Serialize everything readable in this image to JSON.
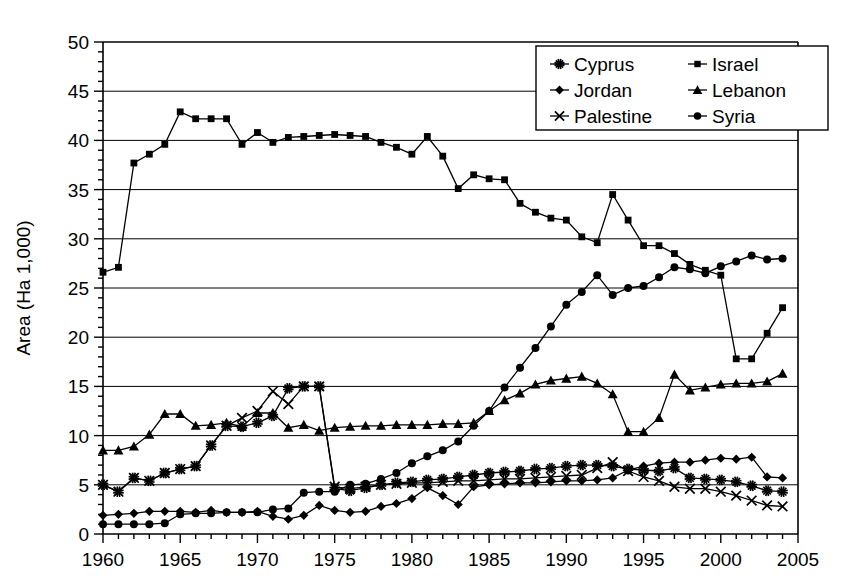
{
  "chart_data": {
    "type": "line",
    "title": "",
    "xlabel": "",
    "ylabel": "Area (Ha 1,000)",
    "xlim": [
      1960,
      2005
    ],
    "ylim": [
      0,
      50
    ],
    "xticks": [
      1960,
      1965,
      1970,
      1975,
      1980,
      1985,
      1990,
      1995,
      2000,
      2005
    ],
    "yticks": [
      0,
      5,
      10,
      15,
      20,
      25,
      30,
      35,
      40,
      45,
      50
    ],
    "x_minor_step": 1,
    "y_minor_step": 1,
    "grid": "horizontal-major",
    "legend_position": "top-right",
    "legend_entries": [
      "Cyprus",
      "Israel",
      "Jordan",
      "Lebanon",
      "Palestine",
      "Syria"
    ],
    "x": [
      1960,
      1961,
      1962,
      1963,
      1964,
      1965,
      1966,
      1967,
      1968,
      1969,
      1970,
      1971,
      1972,
      1973,
      1974,
      1975,
      1976,
      1977,
      1978,
      1979,
      1980,
      1981,
      1982,
      1983,
      1984,
      1985,
      1986,
      1987,
      1988,
      1989,
      1990,
      1991,
      1992,
      1993,
      1994,
      1995,
      1996,
      1997,
      1998,
      1999,
      2000,
      2001,
      2002,
      2003,
      2004
    ],
    "series": [
      {
        "name": "Cyprus",
        "marker": "asterisk",
        "color": "#000000",
        "values": [
          5.0,
          4.3,
          5.7,
          5.4,
          6.2,
          6.6,
          6.9,
          9.0,
          11.0,
          10.9,
          11.3,
          12.0,
          14.8,
          15.0,
          15.0,
          4.6,
          4.4,
          4.7,
          5.0,
          5.2,
          5.3,
          5.5,
          5.6,
          5.8,
          6.0,
          6.2,
          6.3,
          6.4,
          6.6,
          6.7,
          6.9,
          7.0,
          7.0,
          6.9,
          6.6,
          6.5,
          6.4,
          6.7,
          5.7,
          5.6,
          5.5,
          5.3,
          4.9,
          4.4,
          4.3
        ]
      },
      {
        "name": "Israel",
        "marker": "square",
        "color": "#000000",
        "values": [
          26.6,
          27.1,
          37.7,
          38.6,
          39.6,
          42.9,
          42.2,
          42.2,
          42.2,
          39.6,
          40.8,
          39.8,
          40.3,
          40.4,
          40.5,
          40.6,
          40.5,
          40.4,
          39.8,
          39.3,
          38.6,
          40.4,
          38.4,
          35.1,
          36.5,
          36.1,
          36.0,
          33.6,
          32.7,
          32.1,
          31.9,
          30.2,
          29.6,
          34.5,
          31.9,
          29.3,
          29.3,
          28.5,
          27.4,
          26.8,
          26.3,
          17.8,
          17.8,
          20.4,
          23.0
        ]
      },
      {
        "name": "Jordan",
        "marker": "diamond",
        "color": "#000000",
        "values": [
          1.9,
          2.0,
          2.1,
          2.3,
          2.3,
          2.3,
          2.2,
          2.4,
          2.2,
          2.2,
          2.3,
          1.8,
          1.5,
          1.9,
          2.9,
          2.4,
          2.2,
          2.3,
          2.8,
          3.1,
          3.6,
          4.7,
          3.9,
          3.0,
          4.8,
          5.0,
          5.1,
          5.2,
          5.2,
          5.3,
          5.4,
          5.4,
          5.5,
          5.7,
          6.5,
          6.9,
          7.2,
          7.3,
          7.3,
          7.5,
          7.7,
          7.6,
          7.8,
          5.8,
          5.7
        ]
      },
      {
        "name": "Lebanon",
        "marker": "triangle",
        "color": "#000000",
        "values": [
          8.5,
          8.5,
          8.9,
          10.1,
          12.2,
          12.2,
          11.0,
          11.1,
          11.3,
          10.9,
          12.3,
          12.3,
          10.8,
          11.1,
          10.5,
          10.8,
          10.9,
          11.0,
          11.0,
          11.1,
          11.1,
          11.1,
          11.2,
          11.2,
          11.3,
          12.5,
          13.6,
          14.3,
          15.2,
          15.6,
          15.8,
          16.0,
          15.3,
          14.2,
          10.4,
          10.4,
          11.8,
          16.2,
          14.6,
          14.9,
          15.2,
          15.3,
          15.3,
          15.5,
          16.3
        ]
      },
      {
        "name": "Palestine",
        "marker": "cross",
        "color": "#000000",
        "values": [
          5.0,
          4.3,
          5.7,
          5.4,
          6.2,
          6.6,
          6.9,
          9.0,
          11.0,
          11.8,
          12.5,
          14.5,
          13.2,
          15.0,
          15.0,
          4.8,
          4.6,
          4.8,
          5.0,
          5.1,
          5.2,
          5.2,
          5.3,
          5.4,
          5.4,
          5.5,
          5.6,
          5.6,
          5.7,
          5.8,
          5.9,
          6.0,
          6.7,
          7.3,
          6.4,
          5.8,
          5.4,
          4.8,
          4.6,
          4.6,
          4.3,
          3.9,
          3.4,
          2.9,
          2.8
        ]
      },
      {
        "name": "Syria",
        "marker": "circle",
        "color": "#000000",
        "values": [
          1.0,
          1.0,
          1.0,
          1.0,
          1.1,
          2.0,
          2.1,
          2.1,
          2.2,
          2.2,
          2.2,
          2.5,
          2.6,
          4.2,
          4.3,
          4.3,
          5.0,
          5.1,
          5.6,
          6.2,
          7.2,
          7.9,
          8.5,
          9.4,
          11.0,
          12.5,
          14.9,
          16.9,
          18.9,
          21.1,
          23.3,
          24.6,
          26.3,
          24.3,
          25.0,
          25.2,
          26.1,
          27.1,
          26.9,
          26.5,
          27.2,
          27.7,
          28.3,
          27.9,
          28.0
        ]
      }
    ]
  }
}
